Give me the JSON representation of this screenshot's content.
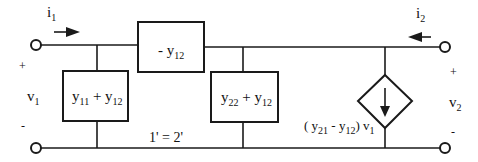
{
  "diagram": {
    "type": "two-port y-parameter equivalent circuit (pi network)",
    "colors": {
      "stroke": "#1a1a1a",
      "background": "#ffffff"
    },
    "port1": {
      "current": {
        "sym": "i",
        "sub": "1",
        "direction": "right"
      },
      "voltage": {
        "sym": "v",
        "sub": "1"
      },
      "plus": "+",
      "minus": "-"
    },
    "port2": {
      "current": {
        "sym": "i",
        "sub": "2",
        "direction": "left"
      },
      "voltage": {
        "sym": "v",
        "sub": "2"
      },
      "plus": "+",
      "minus": "-"
    },
    "elements": {
      "series": {
        "pre": "- y",
        "sub": "12"
      },
      "shunt_left": {
        "a": "y",
        "a_sub": "11",
        "op": " + y",
        "b_sub": "12"
      },
      "shunt_right": {
        "a": "y",
        "a_sub": "22",
        "op": " + y",
        "b_sub": "12"
      },
      "dependent_source": {
        "open": "( y",
        "s1": "21",
        "mid": " - y",
        "s2": "12",
        "close": ") v",
        "s3": "1",
        "direction": "down"
      }
    },
    "ground_label": "1' = 2'"
  }
}
